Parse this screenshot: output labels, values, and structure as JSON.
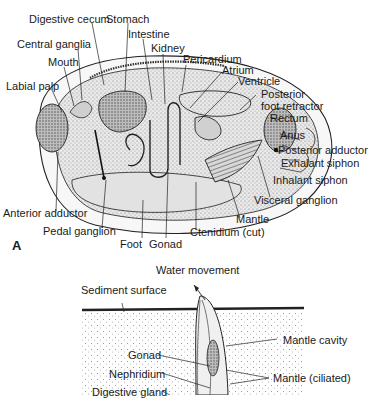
{
  "figure": {
    "panel_a": {
      "panel_label": "A",
      "labels": {
        "digestive_cecum": "Digestive cecum",
        "stomach": "Stomach",
        "intestine": "Intestine",
        "kidney": "Kidney",
        "central_ganglia": "Central ganglia",
        "mouth": "Mouth",
        "labial_palp": "Labial palp",
        "pericardium": "Pericardium",
        "atrium": "Atrium",
        "ventricle": "Ventricle",
        "posterior_foot_retractor": "Posterior\nfoot retractor",
        "rectum": "Rectum",
        "anus": "Anus",
        "posterior_adductor": "Posterior adductor",
        "exhalant_siphon": "Exhalant siphon",
        "inhalant_siphon": "Inhalant siphon",
        "visceral_ganglion": "Visceral ganglion",
        "mantle": "Mantle",
        "ctenidium": "Ctenidium (cut)",
        "anterior_adductor": "Anterior adductor",
        "pedal_ganglion": "Pedal ganglion",
        "foot": "Foot",
        "gonad": "Gonad"
      }
    },
    "panel_b": {
      "labels": {
        "water_movement": "Water movement",
        "sediment_surface": "Sediment surface",
        "mantle_cavity": "Mantle cavity",
        "gonad": "Gonad",
        "nephridium": "Nephridium",
        "mantle_ciliated": "Mantle (ciliated)",
        "digestive_gland": "Digestive gland"
      }
    }
  }
}
